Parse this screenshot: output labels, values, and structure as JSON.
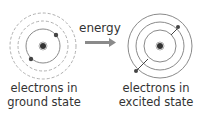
{
  "diagram": {
    "energy_label": "energy",
    "left": {
      "caption_line1": "electrons in",
      "caption_line2": "ground state",
      "state": "ground"
    },
    "right": {
      "caption_line1": "electrons in",
      "caption_line2": "excited state",
      "state": "excited"
    },
    "colors": {
      "solid_orbit": "#8a8a8a",
      "dashed_orbit": "#a8a8a8",
      "nucleus": "#333333",
      "electron": "#444444",
      "arrow": "#8a8a8a",
      "text": "#333333"
    }
  }
}
